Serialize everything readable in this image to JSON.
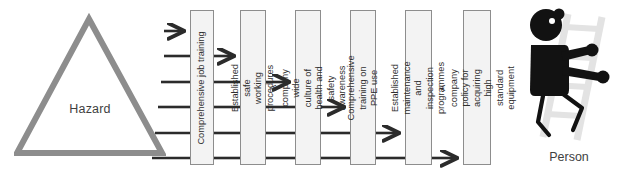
{
  "diagram": {
    "background_color": "#ffffff"
  },
  "hazard": {
    "label": "Hazard",
    "shape": "triangle",
    "outline_color": "#8a8a8a",
    "fill_color": "#ffffff"
  },
  "person": {
    "label": "Person",
    "figure_color": "#111111",
    "ladder_color": "#e3e3e3"
  },
  "barriers": [
    {
      "id": "barrier-1",
      "label": "Comprehensive job training",
      "lines": [
        "Comprehensive job training"
      ],
      "x": 190,
      "width": 24,
      "fill": "#f3f3f3",
      "border": "#8d8d8d"
    },
    {
      "id": "barrier-2",
      "label": "Established safe working procedures",
      "lines": [
        "Established safe working",
        "procedures"
      ],
      "x": 240,
      "width": 26,
      "fill": "#f3f3f3",
      "border": "#8d8d8d"
    },
    {
      "id": "barrier-3",
      "label": "A company wide culture of health and safety awareness",
      "lines": [
        "A company wide culture of",
        "health and safety awareness"
      ],
      "x": 295,
      "width": 26,
      "fill": "#f3f3f3",
      "border": "#8d8d8d"
    },
    {
      "id": "barrier-4",
      "label": "Comprehensive training on PPE use",
      "lines": [
        "Comprehensive training on",
        "PPE use"
      ],
      "x": 350,
      "width": 26,
      "fill": "#f3f3f3",
      "border": "#8d8d8d"
    },
    {
      "id": "barrier-5",
      "label": "Established maintenance and inspection programmes",
      "lines": [
        "Established maintenance and",
        "inspection programmes"
      ],
      "x": 405,
      "width": 27,
      "fill": "#f3f3f3",
      "border": "#8d8d8d"
    },
    {
      "id": "barrier-6",
      "label": "A company policy for acquiring high standard equipment",
      "lines": [
        "A company policy for acquiring",
        "high standard equipment"
      ],
      "x": 463,
      "width": 28,
      "fill": "#f3f3f3",
      "border": "#8d8d8d"
    }
  ],
  "connectors": {
    "line_color": "#2b2b2b",
    "description": "Six horizontal rays leave the hazard triangle; in each gap between barriers the topmost remaining ray carries an arrowhead and the rest are plain lines.",
    "gaps": [
      {
        "id": "gap-0",
        "from": "hazard",
        "to": "barrier-1",
        "ray_count": 6,
        "arrow_index": 0
      },
      {
        "id": "gap-1",
        "from": "barrier-1",
        "to": "barrier-2",
        "ray_count": 5,
        "arrow_index": 0
      },
      {
        "id": "gap-2",
        "from": "barrier-2",
        "to": "barrier-3",
        "ray_count": 4,
        "arrow_index": 0
      },
      {
        "id": "gap-3",
        "from": "barrier-3",
        "to": "barrier-4",
        "ray_count": 3,
        "arrow_index": 0
      },
      {
        "id": "gap-4",
        "from": "barrier-4",
        "to": "barrier-5",
        "ray_count": 2,
        "arrow_index": 0
      },
      {
        "id": "gap-5",
        "from": "barrier-5",
        "to": "barrier-6",
        "ray_count": 1,
        "arrow_index": 0
      }
    ],
    "ray_y_positions": [
      31,
      56,
      82,
      107,
      133,
      158
    ]
  }
}
